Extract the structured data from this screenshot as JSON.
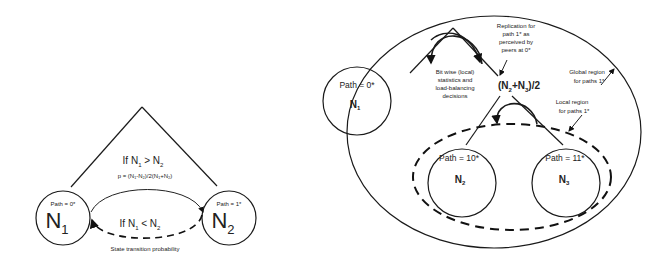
{
  "left_diagram": {
    "node_a": {
      "path_label": "Path = 0*",
      "name": "N",
      "subscript": "1"
    },
    "node_b": {
      "path_label": "Path = 1*",
      "name": "N",
      "subscript": "2"
    },
    "upper_condition": {
      "prefix": "If N",
      "sub1": "1",
      "op": " > N",
      "sub2": "2"
    },
    "probability": "p = (N₁-N₂)/2(N₁+N₂)",
    "lower_condition": {
      "prefix": "If N",
      "sub1": "1",
      "op": " < N",
      "sub2": "2"
    },
    "caption": "State transition probability"
  },
  "right_diagram": {
    "node_1": {
      "path_label": "Path = 0*",
      "name": "N",
      "subscript": "1"
    },
    "node_2": {
      "path_label": "Path = 10*",
      "name": "N",
      "subscript": "2"
    },
    "node_3": {
      "path_label": "Path = 11*",
      "name": "N",
      "subscript": "3"
    },
    "average_label": {
      "open": "(N",
      "sub1": "2",
      "plus": "+N",
      "sub2": "3",
      "close": ")/2"
    },
    "bitwise_note": [
      "Bit wise (local)",
      "statistics and",
      "load-balancing",
      "decisions"
    ],
    "replication_note": [
      "Replication  for",
      "path 1* as",
      "perceived by",
      "peers at 0*"
    ],
    "global_region_note": [
      "Global region",
      "for paths 1*"
    ],
    "local_region_note": [
      "Local region",
      "for paths 1*"
    ]
  }
}
